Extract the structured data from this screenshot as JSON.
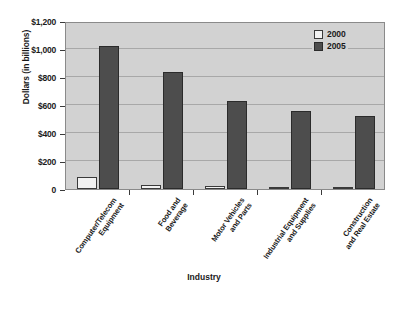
{
  "chart_data": {
    "type": "bar",
    "title": "",
    "xlabel": "Industry",
    "ylabel": "Dollars (in billions)",
    "categories": [
      "Computer/Telecom\nEquipment",
      "Food and\nBeverage",
      "Motor Vehicles\nand Parts",
      "Industrial Equipment\nand Supplies",
      "Construction\nand Real Estate"
    ],
    "category_lines": [
      [
        "Computer/Telecom",
        "Equipment"
      ],
      [
        "Food and",
        "Beverage"
      ],
      [
        "Motor Vehicles",
        "and Parts"
      ],
      [
        "Industrial Equipment",
        "and Supplies"
      ],
      [
        "Construction",
        "and Real Estate"
      ]
    ],
    "series": [
      {
        "name": "2000",
        "color": "#f2f2f2",
        "values": [
          85,
          30,
          18,
          15,
          16
        ]
      },
      {
        "name": "2005",
        "color": "#4d4d4d",
        "values": [
          1025,
          835,
          630,
          555,
          520
        ]
      }
    ],
    "ylim": [
      0,
      1200
    ],
    "ytick_values": [
      1200,
      1000,
      800,
      600,
      400,
      200,
      0
    ],
    "ytick_labels": [
      "$1,200",
      "$1,000",
      "$800",
      "$600",
      "$400",
      "$200",
      "0"
    ],
    "grid": true,
    "legend_position": "top-right",
    "plot_background": "#d2d2d2",
    "frame_color": "#8a8a8a"
  },
  "legend": {
    "entries": [
      {
        "label": "2000"
      },
      {
        "label": "2005"
      }
    ]
  }
}
